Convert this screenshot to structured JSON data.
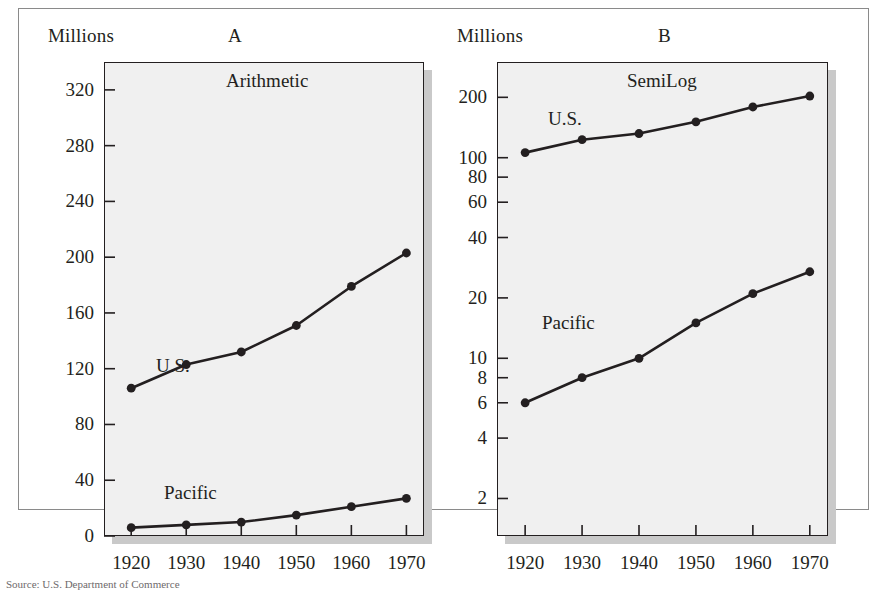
{
  "figure": {
    "source_note": "Source: U.S. Department of Commerce",
    "units_label": "Millions"
  },
  "panels": [
    {
      "letter": "A",
      "title": "Arithmetic",
      "units": "Millions",
      "series_labels": {
        "us": "U.S.",
        "pacific": "Pacific"
      },
      "yticks": [
        "0",
        "40",
        "80",
        "120",
        "160",
        "200",
        "240",
        "280",
        "320"
      ],
      "xticks": [
        "1920",
        "1930",
        "1940",
        "1950",
        "1960",
        "1970"
      ]
    },
    {
      "letter": "B",
      "title": "SemiLog",
      "units": "Millions",
      "series_labels": {
        "us": "U.S.",
        "pacific": "Pacific"
      },
      "yticks": [
        "2",
        "4",
        "6",
        "8",
        "10",
        "20",
        "40",
        "60",
        "80",
        "100",
        "200"
      ],
      "xticks": [
        "1920",
        "1930",
        "1940",
        "1950",
        "1960",
        "1970"
      ]
    }
  ],
  "colors": {
    "ink": "#231f20",
    "plot_background": "#f0f0f0",
    "shadow": "#c9c9c9",
    "frame": "#8a8a8a"
  },
  "chart_data": [
    {
      "type": "line",
      "panel": "A",
      "title": "Arithmetic",
      "ylabel": "Millions",
      "xlabel": "",
      "scale": "linear",
      "ylim": [
        0,
        340
      ],
      "grid": false,
      "legend": "inline-labels",
      "x": [
        1920,
        1930,
        1940,
        1950,
        1960,
        1970
      ],
      "yticks": [
        0,
        40,
        80,
        120,
        160,
        200,
        240,
        280,
        320
      ],
      "series": [
        {
          "name": "U.S.",
          "values": [
            106,
            123,
            132,
            151,
            179,
            203
          ]
        },
        {
          "name": "Pacific",
          "values": [
            6,
            8,
            10,
            15,
            21,
            27
          ]
        }
      ]
    },
    {
      "type": "line",
      "panel": "B",
      "title": "SemiLog",
      "ylabel": "Millions",
      "xlabel": "",
      "scale": "log",
      "ylim": [
        1.3,
        300
      ],
      "grid": false,
      "legend": "inline-labels",
      "x": [
        1920,
        1930,
        1940,
        1950,
        1960,
        1970
      ],
      "yticks": [
        2,
        4,
        6,
        8,
        10,
        20,
        40,
        60,
        80,
        100,
        200
      ],
      "series": [
        {
          "name": "U.S.",
          "values": [
            106,
            123,
            132,
            151,
            179,
            203
          ]
        },
        {
          "name": "Pacific",
          "values": [
            6,
            8,
            10,
            15,
            21,
            27
          ]
        }
      ]
    }
  ]
}
